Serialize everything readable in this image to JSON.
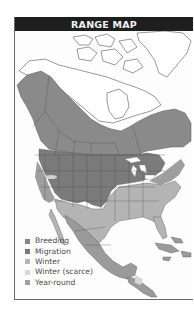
{
  "header": {
    "title": "RANGE MAP"
  },
  "map": {
    "region": "North America",
    "colors": {
      "breeding": "#8a8a8a",
      "migration": "#7b7b7b",
      "winter": "#b4b4b4",
      "winter_scarce": "#d6d6d6",
      "year_round": "#9e9e9e",
      "water": "#ffffff",
      "outline": "#555555"
    }
  },
  "legend": {
    "items": [
      {
        "label": "Breeding",
        "color": "#868686"
      },
      {
        "label": "Migration",
        "color": "#7a7a7a"
      },
      {
        "label": "Winter",
        "color": "#b6b6b6"
      },
      {
        "label": "Winter (scarce)",
        "color": "#d8d8d8"
      },
      {
        "label": "Year-round",
        "color": "#a0a0a0"
      }
    ]
  }
}
